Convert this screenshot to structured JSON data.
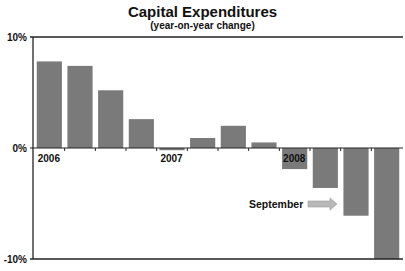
{
  "chart_data": {
    "type": "bar",
    "title": "Capital Expenditures",
    "subtitle": "(year-on-year change)",
    "xlabel": "",
    "ylabel": "",
    "ylim": [
      -10,
      10
    ],
    "y_ticks": [
      {
        "value": 10,
        "label": "10%"
      },
      {
        "value": 0,
        "label": "0%"
      },
      {
        "value": -10,
        "label": "-10%"
      }
    ],
    "categories": [
      "2006 Q1",
      "2006 Q2",
      "2006 Q3",
      "2006 Q4",
      "2007 Q1",
      "2007 Q2",
      "2007 Q3",
      "2007 Q4",
      "2008 Q1",
      "2008 Q2",
      "2008 Q3",
      "2008 Q4"
    ],
    "year_labels": [
      {
        "label": "2006",
        "index": 0
      },
      {
        "label": "2007",
        "index": 4
      },
      {
        "label": "2008",
        "index": 8
      }
    ],
    "values": [
      7.8,
      7.4,
      5.2,
      2.6,
      -0.2,
      0.9,
      2.0,
      0.5,
      -1.9,
      -3.6,
      -6.1,
      -10.0
    ],
    "bar_color": "#7a7a7a",
    "grid": false,
    "legend": "none",
    "annotation": {
      "text": "September",
      "arrow": "right-arrow",
      "points_to_index": 10,
      "arrow_color": "#b8b8b8"
    }
  }
}
